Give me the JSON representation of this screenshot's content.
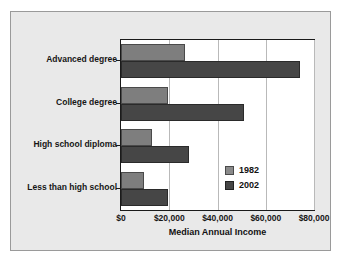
{
  "chart_data": {
    "type": "bar",
    "orientation": "horizontal",
    "title": "",
    "xlabel": "Median Annual Income",
    "ylabel": "",
    "categories": [
      "Advanced degree",
      "College degree",
      "High school diploma",
      "Less than high school"
    ],
    "series": [
      {
        "name": "1982",
        "color": "#7e7e7e",
        "values": [
          26500,
          19500,
          13000,
          9500
        ]
      },
      {
        "name": "2002",
        "color": "#464646",
        "values": [
          74000,
          51000,
          28000,
          19500
        ]
      }
    ],
    "xlim": [
      0,
      80000
    ],
    "xticks": [
      0,
      20000,
      40000,
      60000,
      80000
    ],
    "xtick_labels": [
      "$0",
      "$20,000",
      "$40,000",
      "$60,000",
      "$80,000"
    ],
    "grid": true,
    "grid_axis": "x",
    "legend_position": "inside-right",
    "legend": [
      "1982",
      "2002"
    ]
  },
  "colors": {
    "panel_background": "#e9e9e9",
    "plot_background": "#ffffff",
    "frame": "#1a1a1a",
    "gridline": "#b9b9b9",
    "series_1982": "#7e7e7e",
    "series_2002": "#464646",
    "text": "#121212"
  }
}
